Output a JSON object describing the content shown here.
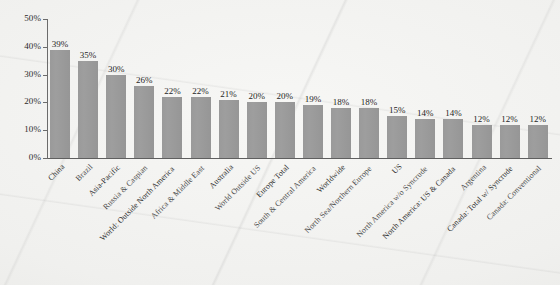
{
  "chart_data": {
    "type": "bar",
    "title": "",
    "xlabel": "",
    "ylabel": "",
    "ylim": [
      0,
      50
    ],
    "ytick_labels": [
      "0%",
      "10%",
      "20%",
      "30%",
      "40%",
      "50%"
    ],
    "ytick_values": [
      0,
      10,
      20,
      30,
      40,
      50
    ],
    "grid": false,
    "legend": "none",
    "value_suffix": "%",
    "bar_color": "#969696",
    "categories": [
      "China",
      "Brazil",
      "Asia-Pacific",
      "Russia & Caspian",
      "World: Outside North America",
      "Africa & Middle East",
      "Australia",
      "World Outside US",
      "Europe Total",
      "South & Central America",
      "Worldwide",
      "North Sea/Northern Europe",
      "US",
      "North America w/o Syncrude",
      "North America: US & Canada",
      "Argentina",
      "Canada: Total w/ Syncrude",
      "Canada: Conventional"
    ],
    "values": [
      39,
      35,
      30,
      26,
      22,
      22,
      21,
      20,
      20,
      19,
      18,
      18,
      15,
      14,
      14,
      12,
      12,
      12
    ],
    "value_labels": [
      "39%",
      "35%",
      "30%",
      "26%",
      "22%",
      "22%",
      "21%",
      "20%",
      "20%",
      "19%",
      "18%",
      "18%",
      "15%",
      "14%",
      "14%",
      "12%",
      "12%",
      "12%"
    ]
  }
}
